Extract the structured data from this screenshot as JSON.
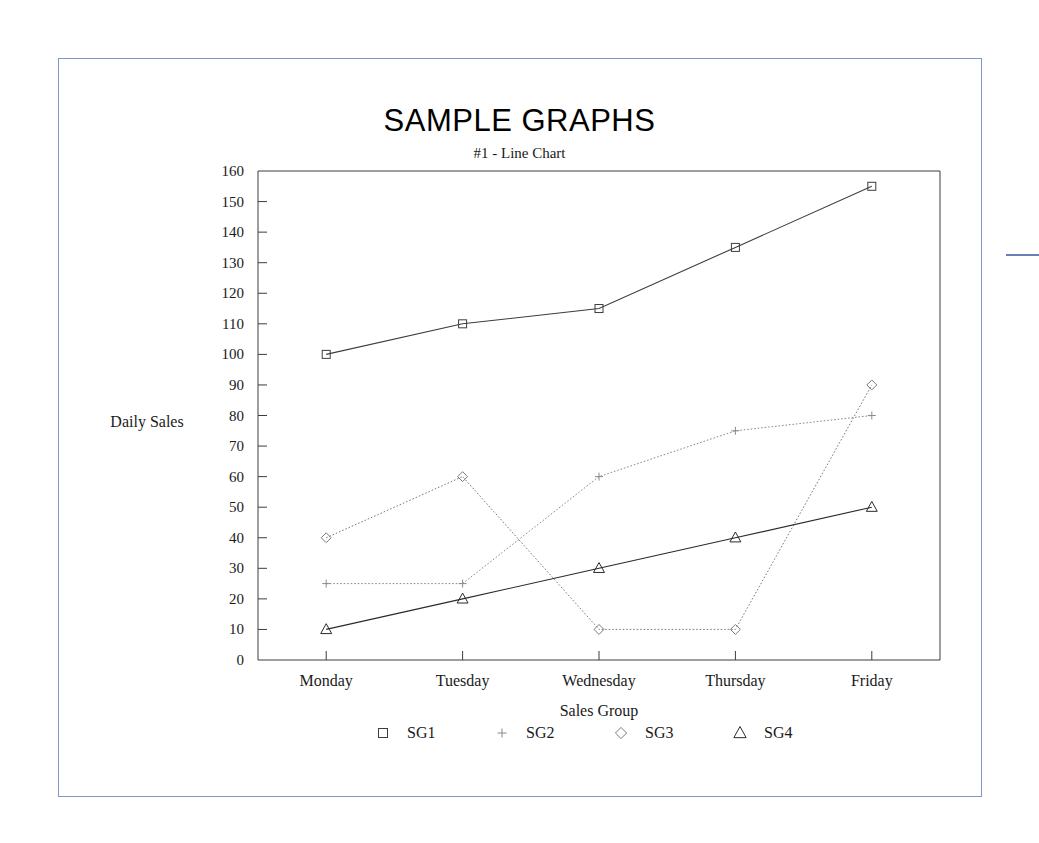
{
  "document": {
    "border_color": "#8296c8",
    "background": "#ffffff",
    "edge_mark_color": "#6b7fb5"
  },
  "chart_data": {
    "type": "line",
    "title": "SAMPLE GRAPHS",
    "subtitle": "#1 - Line Chart",
    "xlabel": "Sales Group",
    "ylabel": "Daily Sales",
    "categories": [
      "Monday",
      "Tuesday",
      "Wednesday",
      "Thursday",
      "Friday"
    ],
    "ylim": [
      0,
      160
    ],
    "ytick_step": 10,
    "ytick_labels": [
      "160",
      "150",
      "140",
      "130",
      "120",
      "110",
      "100",
      "90",
      "80",
      "70",
      "60",
      "50",
      "40",
      "30",
      "20",
      "10",
      "0"
    ],
    "grid": false,
    "legend_position": "bottom",
    "series": [
      {
        "name": "SG1",
        "marker": "square",
        "line_style": "solid",
        "color": "#3d3d3d",
        "values": [
          100,
          110,
          115,
          135,
          155
        ]
      },
      {
        "name": "SG2",
        "marker": "plus",
        "line_style": "dotted",
        "color": "#8a8a8a",
        "values": [
          25,
          25,
          60,
          75,
          80
        ]
      },
      {
        "name": "SG3",
        "marker": "diamond",
        "line_style": "dotted",
        "color": "#7a7a7a",
        "values": [
          40,
          60,
          10,
          10,
          90
        ]
      },
      {
        "name": "SG4",
        "marker": "triangle",
        "line_style": "solid",
        "color": "#2b2b2b",
        "values": [
          10,
          20,
          30,
          40,
          50
        ]
      }
    ]
  }
}
